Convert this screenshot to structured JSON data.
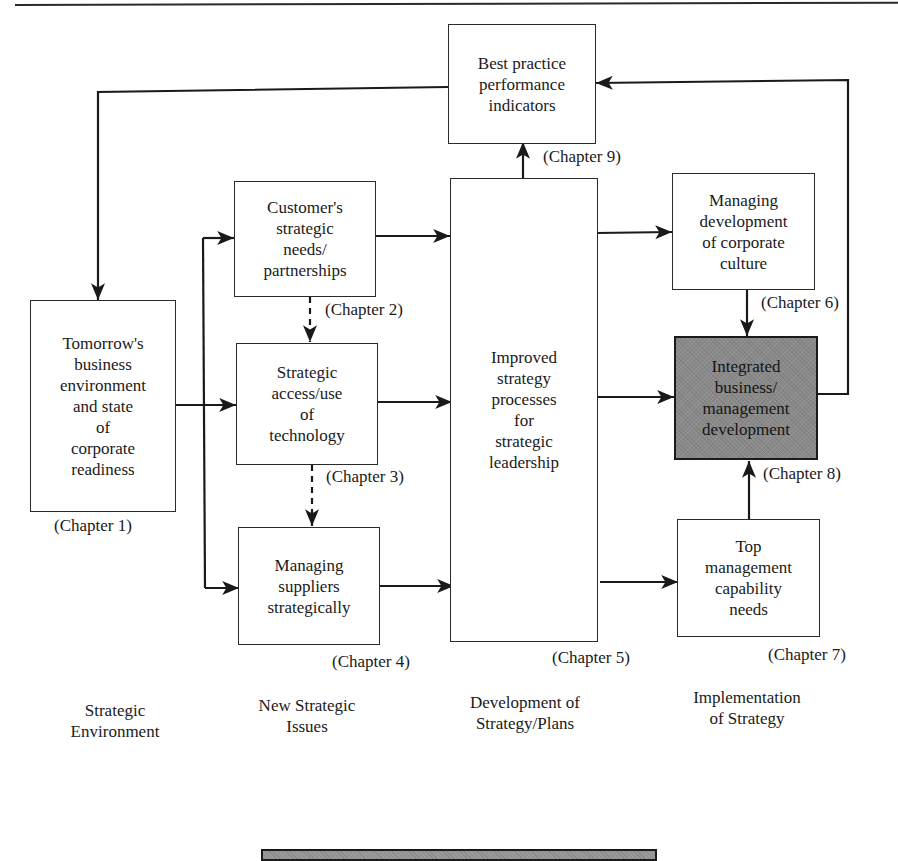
{
  "diagram": {
    "nodes": {
      "best_practice": {
        "label": "Best practice\nperformance\nindicators",
        "chapter": "(Chapter 9)"
      },
      "tomorrows_business": {
        "label": "Tomorrow's\nbusiness\nenvironment\nand state\nof\ncorporate\nreadiness",
        "chapter": "(Chapter 1)"
      },
      "customers_needs": {
        "label": "Customer's\nstrategic\nneeds/\npartnerships",
        "chapter": "(Chapter 2)"
      },
      "strategic_access": {
        "label": "Strategic\naccess/use\nof\ntechnology",
        "chapter": "(Chapter 3)"
      },
      "managing_suppliers": {
        "label": "Managing\nsuppliers\nstrategically",
        "chapter": "(Chapter 4)"
      },
      "improved_strategy": {
        "label": "Improved\nstrategy\nprocesses\nfor\nstrategic\nleadership",
        "chapter": "(Chapter 5)"
      },
      "corporate_culture": {
        "label": "Managing\ndevelopment\nof corporate\nculture",
        "chapter": "(Chapter 6)"
      },
      "integrated_development": {
        "label": "Integrated\nbusiness/\nmanagement\ndevelopment",
        "chapter": "(Chapter 8)",
        "fill": "#8a8a8a"
      },
      "top_management": {
        "label": "Top\nmanagement\ncapability\nneeds",
        "chapter": "(Chapter 7)"
      }
    },
    "columns": [
      {
        "label": "Strategic\nEnvironment"
      },
      {
        "label": "New Strategic\nIssues"
      },
      {
        "label": "Development of\nStrategy/Plans"
      },
      {
        "label": "Implementation\nof Strategy"
      }
    ],
    "edges": [
      {
        "from": "best_practice",
        "to": "tomorrows_business",
        "style": "solid"
      },
      {
        "from": "tomorrows_business",
        "to": "customers_needs",
        "style": "solid"
      },
      {
        "from": "tomorrows_business",
        "to": "strategic_access",
        "style": "solid"
      },
      {
        "from": "tomorrows_business",
        "to": "managing_suppliers",
        "style": "solid"
      },
      {
        "from": "customers_needs",
        "to": "strategic_access",
        "style": "dashed"
      },
      {
        "from": "strategic_access",
        "to": "managing_suppliers",
        "style": "dashed"
      },
      {
        "from": "customers_needs",
        "to": "improved_strategy",
        "style": "solid"
      },
      {
        "from": "strategic_access",
        "to": "improved_strategy",
        "style": "solid"
      },
      {
        "from": "managing_suppliers",
        "to": "improved_strategy",
        "style": "solid"
      },
      {
        "from": "improved_strategy",
        "to": "best_practice",
        "style": "solid"
      },
      {
        "from": "improved_strategy",
        "to": "corporate_culture",
        "style": "solid"
      },
      {
        "from": "improved_strategy",
        "to": "integrated_development",
        "style": "solid"
      },
      {
        "from": "improved_strategy",
        "to": "top_management",
        "style": "solid"
      },
      {
        "from": "corporate_culture",
        "to": "integrated_development",
        "style": "solid"
      },
      {
        "from": "top_management",
        "to": "integrated_development",
        "style": "solid"
      },
      {
        "from": "integrated_development",
        "to": "best_practice",
        "style": "solid"
      }
    ],
    "colors": {
      "line": "#1a1a1a",
      "highlight_fill": "#8a8a8a",
      "background": "#ffffff"
    }
  }
}
